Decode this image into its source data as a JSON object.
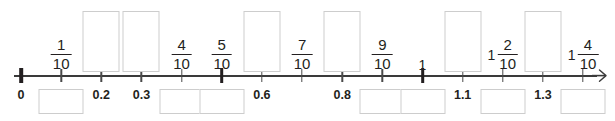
{
  "worksheet": {
    "title": "Number line from 0 to 1 4/10 in tenths",
    "axis": {
      "min": 0,
      "max": 1.4,
      "tick_step": 0.1,
      "start_px": 21,
      "spacing_px": 40.15,
      "line_color": "#3a3a3a",
      "bold_tick_values": [
        0,
        0.5,
        1
      ],
      "arrow_end": "right"
    },
    "ticks": [
      {
        "value": 0,
        "label_decimal": "0",
        "bold": true
      },
      {
        "value": 0.1,
        "label_decimal": "",
        "bold": false
      },
      {
        "value": 0.2,
        "label_decimal": "0.2",
        "bold": false
      },
      {
        "value": 0.3,
        "label_decimal": "0.3",
        "bold": false
      },
      {
        "value": 0.4,
        "label_decimal": "",
        "bold": false
      },
      {
        "value": 0.5,
        "label_decimal": "",
        "bold": true
      },
      {
        "value": 0.6,
        "label_decimal": "0.6",
        "bold": false
      },
      {
        "value": 0.7,
        "label_decimal": "",
        "bold": false
      },
      {
        "value": 0.8,
        "label_decimal": "0.8",
        "bold": false
      },
      {
        "value": 0.9,
        "label_decimal": "",
        "bold": false
      },
      {
        "value": 1.0,
        "label_decimal": "",
        "bold": true
      },
      {
        "value": 1.1,
        "label_decimal": "1.1",
        "bold": false
      },
      {
        "value": 1.2,
        "label_decimal": "",
        "bold": false
      },
      {
        "value": 1.3,
        "label_decimal": "1.3",
        "bold": false
      },
      {
        "value": 1.4,
        "label_decimal": "",
        "bold": false
      }
    ],
    "labels_above": [
      {
        "position": 0.1,
        "whole": "",
        "numerator": "1",
        "denominator": "10"
      },
      {
        "position": 0.4,
        "whole": "",
        "numerator": "4",
        "denominator": "10"
      },
      {
        "position": 0.5,
        "whole": "",
        "numerator": "5",
        "denominator": "10"
      },
      {
        "position": 0.7,
        "whole": "",
        "numerator": "7",
        "denominator": "10"
      },
      {
        "position": 0.9,
        "whole": "",
        "numerator": "9",
        "denominator": "10"
      },
      {
        "position": 1.0,
        "whole": "1",
        "numerator": "",
        "denominator": ""
      },
      {
        "position": 1.2,
        "whole": "1",
        "numerator": "2",
        "denominator": "10"
      },
      {
        "position": 1.4,
        "whole": "1",
        "numerator": "4",
        "denominator": "10"
      }
    ],
    "labels_below": [
      {
        "position": 0.0,
        "text": "0"
      },
      {
        "position": 0.2,
        "text": "0.2"
      },
      {
        "position": 0.3,
        "text": "0.3"
      },
      {
        "position": 0.6,
        "text": "0.6"
      },
      {
        "position": 0.8,
        "text": "0.8"
      },
      {
        "position": 1.1,
        "text": "1.1"
      },
      {
        "position": 1.3,
        "text": "1.3"
      }
    ],
    "answer_boxes_above": [
      {
        "position": 0.2,
        "value": ""
      },
      {
        "position": 0.3,
        "value": ""
      },
      {
        "position": 0.6,
        "value": ""
      },
      {
        "position": 0.8,
        "value": ""
      },
      {
        "position": 1.1,
        "value": ""
      },
      {
        "position": 1.3,
        "value": ""
      }
    ],
    "answer_boxes_below": [
      {
        "position": 0.1,
        "value": ""
      },
      {
        "position": 0.4,
        "value": ""
      },
      {
        "position": 0.5,
        "value": ""
      },
      {
        "position": 0.9,
        "value": ""
      },
      {
        "position": 1.0,
        "value": ""
      },
      {
        "position": 1.2,
        "value": ""
      },
      {
        "position": 1.4,
        "value": ""
      }
    ]
  }
}
